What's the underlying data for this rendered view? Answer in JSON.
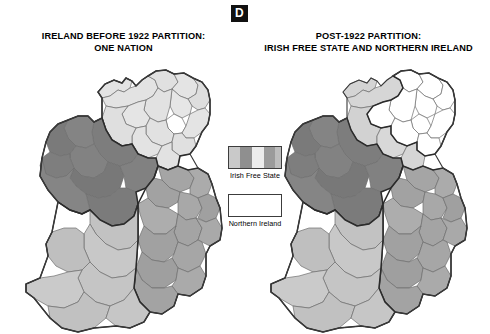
{
  "badge": {
    "label": "D"
  },
  "panels": [
    {
      "id": "before-partition",
      "title_line1": "IRELAND BEFORE 1922 PARTITION:",
      "title_line2": "ONE NATION"
    },
    {
      "id": "post-partition",
      "title_line1": "POST-1922 PARTITION:",
      "title_line2": "IRISH FREE STATE AND NORTHERN IRELAND"
    }
  ],
  "legend": {
    "items": [
      {
        "label": "Irish Free State",
        "swatch": "striped-gray"
      },
      {
        "label": "Northern Ireland",
        "swatch": "white"
      }
    ]
  },
  "colors": {
    "connacht": "#808080",
    "ulster": "#e0e0e0",
    "leinster": "#a8a8a8",
    "munster": "#c4c4c4",
    "northern_ireland": "#ffffff",
    "badge_bg": "#111111",
    "badge_fg": "#ffffff",
    "county_stroke": "#6f6f6f",
    "province_stroke": "#2b2b2b"
  },
  "map_regions": {
    "provinces": [
      "Ulster",
      "Connacht",
      "Leinster",
      "Munster"
    ],
    "northern_ireland_counties": [
      "Antrim",
      "Armagh",
      "Down",
      "Fermanagh",
      "Londonderry",
      "Tyrone"
    ]
  }
}
